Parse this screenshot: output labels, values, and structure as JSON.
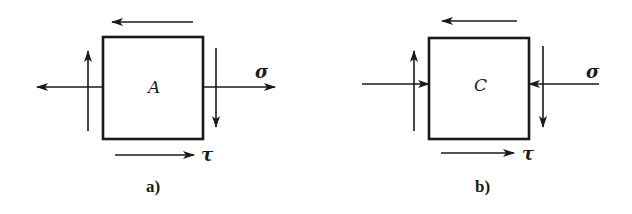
{
  "figure": {
    "colors": {
      "ink": "#1a1a1a",
      "background": "#ffffff"
    },
    "panels": [
      {
        "id": "a",
        "element_label": "A",
        "caption": "a)",
        "normal_stress_label": "σ",
        "shear_stress_label": "τ",
        "normal_stress_type": "tension (arrows point away from element)"
      },
      {
        "id": "b",
        "element_label": "C",
        "caption": "b)",
        "normal_stress_label": "σ",
        "shear_stress_label": "τ",
        "normal_stress_type": "compression (arrows point into element)"
      }
    ]
  }
}
